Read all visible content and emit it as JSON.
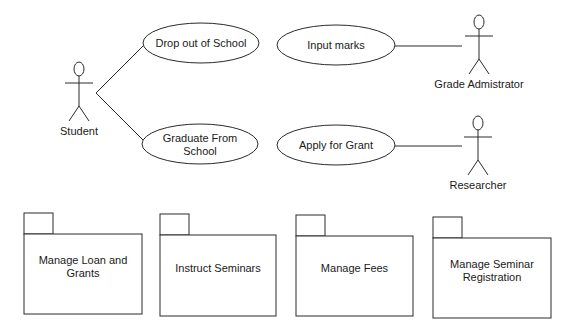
{
  "diagram": {
    "type": "uml-use-case-and-package",
    "actors": [
      {
        "id": "student",
        "label": "Student",
        "x": 79,
        "headY": 69
      },
      {
        "id": "grade-admin",
        "label": "Grade Admistrator",
        "x": 479,
        "headY": 22
      },
      {
        "id": "researcher",
        "label": "Researcher",
        "x": 478,
        "headY": 123
      }
    ],
    "use_cases": [
      {
        "id": "drop-out",
        "lines": [
          "Drop out of School"
        ],
        "cx": 201,
        "cy": 43,
        "rx": 58,
        "ry": 20
      },
      {
        "id": "graduate",
        "lines": [
          "Graduate From",
          "School"
        ],
        "cx": 200,
        "cy": 144,
        "rx": 58,
        "ry": 20
      },
      {
        "id": "input-marks",
        "lines": [
          "Input marks"
        ],
        "cx": 336,
        "cy": 45,
        "rx": 59,
        "ry": 20
      },
      {
        "id": "apply-grant",
        "lines": [
          "Apply for Grant"
        ],
        "cx": 336,
        "cy": 145,
        "rx": 59,
        "ry": 20
      }
    ],
    "associations": [
      {
        "from": "student",
        "to": "drop-out",
        "x1": 96,
        "y1": 93,
        "x2": 144,
        "y2": 45
      },
      {
        "from": "student",
        "to": "graduate",
        "x1": 96,
        "y1": 93,
        "x2": 144,
        "y2": 141
      },
      {
        "from": "input-marks",
        "to": "grade-admin",
        "x1": 395,
        "y1": 46,
        "x2": 462,
        "y2": 46
      },
      {
        "from": "apply-grant",
        "to": "researcher",
        "x1": 395,
        "y1": 146,
        "x2": 462,
        "y2": 146
      }
    ],
    "packages": [
      {
        "id": "loan-grants",
        "lines": [
          "Manage Loan and",
          "Grants"
        ],
        "x": 24,
        "y": 234,
        "w": 118,
        "h": 80,
        "tabY": 213
      },
      {
        "id": "instruct-seminars",
        "lines": [
          "Instruct Seminars"
        ],
        "x": 160,
        "y": 235,
        "w": 116,
        "h": 81,
        "tabY": 214
      },
      {
        "id": "manage-fees",
        "lines": [
          "Manage Fees"
        ],
        "x": 296,
        "y": 236,
        "w": 117,
        "h": 80,
        "tabY": 215
      },
      {
        "id": "seminar-registration",
        "lines": [
          "Manage Seminar",
          "Registration"
        ],
        "x": 433,
        "y": 238,
        "w": 118,
        "h": 80,
        "tabY": 217
      }
    ],
    "colors": {
      "line": "#2a2a2a",
      "text": "#1a1a1a",
      "background": "#ffffff"
    }
  }
}
